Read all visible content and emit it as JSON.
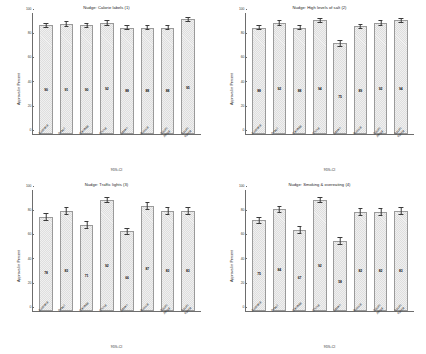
{
  "figure": {
    "categories": [
      "Australia",
      "Brazil",
      "Canada",
      "China",
      "Japan",
      "Russia",
      "South\nAfrica",
      "South\nKorea"
    ],
    "y_axis_label": "Approval in Percent",
    "x_axis_caption": "95%-CI",
    "y_ticks": [
      "0",
      "20",
      "40",
      "60",
      "80",
      "100"
    ],
    "ylim": [
      0,
      100
    ],
    "bar_fill_color": "#dedede",
    "bar_edge_color": "#9a9a9a",
    "error_bar_color": "#3a3a3a"
  },
  "chart_data": [
    {
      "type": "bar",
      "title": "Nudge: Calorie labels (1)",
      "xlabel": "95%-CI",
      "ylabel": "Approval in Percent",
      "ylim": [
        0,
        100
      ],
      "categories": [
        "Australia",
        "Brazil",
        "Canada",
        "China",
        "Japan",
        "Russia",
        "South Africa",
        "South Korea"
      ],
      "values": [
        90,
        91,
        90,
        92,
        88,
        88,
        88,
        95
      ],
      "ci_low": [
        88,
        89,
        88,
        90,
        86,
        86,
        86,
        93
      ],
      "ci_high": [
        92,
        93,
        92,
        94,
        90,
        90,
        90,
        97
      ],
      "grid": false,
      "legend": "none"
    },
    {
      "type": "bar",
      "title": "Nudge: High levels of salt (2)",
      "xlabel": "95%-CI",
      "ylabel": "Approval in Percent",
      "ylim": [
        0,
        100
      ],
      "categories": [
        "Australia",
        "Brazil",
        "Canada",
        "China",
        "Japan",
        "Russia",
        "South Africa",
        "South Korea"
      ],
      "values": [
        88,
        92,
        88,
        94,
        75,
        89,
        92,
        94
      ],
      "ci_low": [
        86,
        90,
        86,
        92,
        72,
        87,
        90,
        92
      ],
      "ci_high": [
        90,
        94,
        90,
        96,
        78,
        91,
        94,
        96
      ],
      "grid": false,
      "legend": "none"
    },
    {
      "type": "bar",
      "title": "Nudge: Traffic lights (3)",
      "xlabel": "95%-CI",
      "ylabel": "Approval in Percent",
      "ylim": [
        0,
        100
      ],
      "categories": [
        "Australia",
        "Brazil",
        "Canada",
        "China",
        "Japan",
        "Russia",
        "South Africa",
        "South Korea"
      ],
      "values": [
        78,
        83,
        71,
        92,
        66,
        87,
        83,
        83
      ],
      "ci_low": [
        75,
        80,
        68,
        90,
        63,
        84,
        80,
        80
      ],
      "ci_high": [
        81,
        86,
        74,
        94,
        69,
        90,
        86,
        86
      ],
      "grid": false,
      "legend": "none"
    },
    {
      "type": "bar",
      "title": "Nudge: Smoking & overeating (4)",
      "xlabel": "95%-CI",
      "ylabel": "Approval in Percent",
      "ylim": [
        0,
        100
      ],
      "categories": [
        "Australia",
        "Brazil",
        "Canada",
        "China",
        "Japan",
        "Russia",
        "South Africa",
        "South Korea"
      ],
      "values": [
        75,
        84,
        67,
        92,
        58,
        82,
        82,
        83
      ],
      "ci_low": [
        72,
        81,
        64,
        90,
        55,
        79,
        79,
        80
      ],
      "ci_high": [
        78,
        87,
        70,
        94,
        61,
        85,
        85,
        86
      ],
      "grid": false,
      "legend": "none"
    }
  ]
}
